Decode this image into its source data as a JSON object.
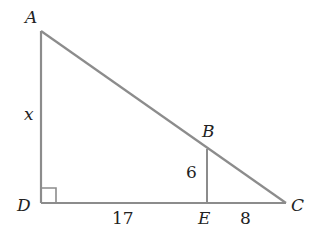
{
  "diagram": {
    "type": "geometry-triangle",
    "points": {
      "A": {
        "label": "A",
        "x": 41,
        "y": 31
      },
      "B": {
        "label": "B",
        "x": 207,
        "y": 149
      },
      "C": {
        "label": "C",
        "x": 286,
        "y": 203
      },
      "D": {
        "label": "D",
        "x": 41,
        "y": 203
      },
      "E": {
        "label": "E",
        "x": 207,
        "y": 203
      }
    },
    "segments": [
      {
        "from": "A",
        "to": "D",
        "label": "x"
      },
      {
        "from": "D",
        "to": "E",
        "label": "17"
      },
      {
        "from": "E",
        "to": "C",
        "label": "8"
      },
      {
        "from": "B",
        "to": "E",
        "label": "6"
      },
      {
        "from": "A",
        "to": "C",
        "label": ""
      }
    ],
    "right_angle_at": "D",
    "line_color": "#8c8c8c",
    "labels": {
      "A": "A",
      "B": "B",
      "C": "C",
      "D": "D",
      "E": "E",
      "x": "x",
      "six": "6",
      "seventeen": "17",
      "eight": "8"
    }
  }
}
